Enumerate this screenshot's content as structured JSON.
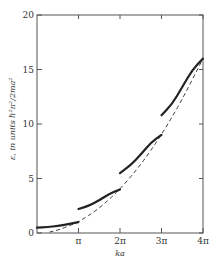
{
  "chart_data": {
    "type": "line",
    "title": "",
    "xlabel": "ka",
    "ylabel": "ε, in units ℏ²π²/2ma²",
    "xlim": [
      0,
      4
    ],
    "xunit": "π",
    "ylim": [
      0,
      20
    ],
    "x_ticks": [
      {
        "value": 1,
        "label": "π"
      },
      {
        "value": 2,
        "label": "2π"
      },
      {
        "value": 3,
        "label": "3π"
      },
      {
        "value": 4,
        "label": "4π"
      }
    ],
    "y_ticks": [
      {
        "value": 0,
        "label": "0"
      },
      {
        "value": 5,
        "label": "5"
      },
      {
        "value": 10,
        "label": "10"
      },
      {
        "value": 15,
        "label": "15"
      },
      {
        "value": 20,
        "label": "20"
      }
    ],
    "grid": false,
    "series": [
      {
        "name": "band-1",
        "style": "solid",
        "x": [
          0,
          0.25,
          0.5,
          0.75,
          1.0
        ],
        "y": [
          0.5,
          0.55,
          0.65,
          0.8,
          1.0
        ]
      },
      {
        "name": "band-2",
        "style": "solid",
        "x": [
          1.0,
          1.25,
          1.5,
          1.75,
          2.0
        ],
        "y": [
          2.2,
          2.5,
          3.0,
          3.6,
          4.0
        ]
      },
      {
        "name": "band-3",
        "style": "solid",
        "x": [
          2.0,
          2.25,
          2.5,
          2.75,
          3.0
        ],
        "y": [
          5.5,
          6.2,
          7.2,
          8.3,
          9.0
        ]
      },
      {
        "name": "band-4",
        "style": "solid",
        "x": [
          3.0,
          3.25,
          3.5,
          3.75,
          4.0
        ],
        "y": [
          10.8,
          11.8,
          13.4,
          15.0,
          16.0
        ]
      },
      {
        "name": "free-electron",
        "style": "dashed",
        "x": [
          0.3,
          0.5,
          1.0,
          1.5,
          2.0,
          2.5,
          3.0,
          3.5,
          4.0
        ],
        "y": [
          0.09,
          0.25,
          1.0,
          2.25,
          4.0,
          6.25,
          9.0,
          12.25,
          16.0
        ]
      }
    ]
  }
}
